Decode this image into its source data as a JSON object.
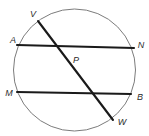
{
  "figure": {
    "kind": "circle-with-chords-diagram",
    "width": 149,
    "height": 136,
    "background_color": "#ffffff",
    "circle": {
      "name": "circle-P",
      "cx": 74.5,
      "cy": 70,
      "r": 61,
      "stroke_color": "#7c7c7c",
      "stroke_width": 1,
      "fill": "none"
    },
    "center_point": {
      "name": "P",
      "x": 77,
      "y": 72
    },
    "chord_style": {
      "stroke_color": "#1a1a1a",
      "stroke_width": 2.1
    },
    "chords": [
      {
        "name": "chord-VW",
        "from": "V",
        "to": "W",
        "x1": 38,
        "y1": 21,
        "x2": 113,
        "y2": 120
      },
      {
        "name": "chord-AN",
        "from": "A",
        "to": "N",
        "x1": 17,
        "y1": 45,
        "x2": 134,
        "y2": 48
      },
      {
        "name": "chord-MB",
        "from": "M",
        "to": "B",
        "x1": 17,
        "y1": 92,
        "x2": 131,
        "y2": 94
      }
    ],
    "labels": [
      {
        "id": "V",
        "text": "V",
        "x": 33,
        "y": 14
      },
      {
        "id": "A",
        "text": "A",
        "x": 13,
        "y": 40
      },
      {
        "id": "N",
        "text": "N",
        "x": 141,
        "y": 45
      },
      {
        "id": "P",
        "text": "P",
        "x": 76,
        "y": 60
      },
      {
        "id": "M",
        "text": "M",
        "x": 9,
        "y": 93
      },
      {
        "id": "B",
        "text": "B",
        "x": 140,
        "y": 97
      },
      {
        "id": "W",
        "text": "W",
        "x": 122,
        "y": 122
      }
    ]
  }
}
